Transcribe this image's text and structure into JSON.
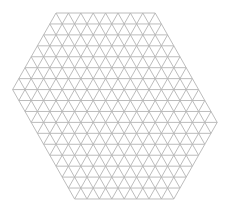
{
  "diagram": {
    "type": "triangular-lattice-hexagon",
    "side_px": 12.4,
    "row_height_px": 10.94,
    "rows": 17,
    "top_edge_segments": 8,
    "bottom_edge_segments": 8,
    "left_vertex_row": 7,
    "right_vertex_row": 10,
    "origin": {
      "x": 56,
      "y": 13
    },
    "line_color": "#b4b4b4",
    "background": "#ffffff",
    "stroke_width": 0.9
  }
}
